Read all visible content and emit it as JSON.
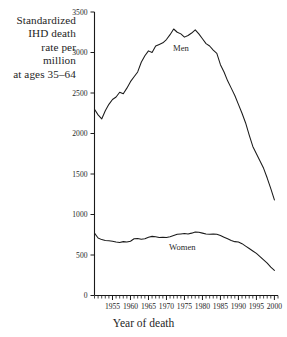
{
  "figure": {
    "y_axis_caption_lines": [
      "Standardized",
      "IHD death",
      "rate per",
      "million",
      "at ages 35–64"
    ],
    "x_axis_title": "Year of death",
    "series_labels": {
      "men": "Men",
      "women": "Women"
    },
    "line_color": "#1a1a1a",
    "axis_color": "#1a1a1a",
    "background": "#ffffff"
  },
  "chart_data": {
    "type": "line",
    "title": "",
    "xlabel": "Year of death",
    "ylabel": "Standardized IHD death rate per million at ages 35–64",
    "xlim": [
      1950,
      2001
    ],
    "ylim": [
      0,
      3500
    ],
    "yticks": [
      0,
      500,
      1000,
      1500,
      2000,
      2500,
      3000,
      3500
    ],
    "ytick_labels": [
      "0",
      "500",
      "1000",
      "1500",
      "2000",
      "2500",
      "3000",
      "3500"
    ],
    "xticks": [
      1955,
      1960,
      1965,
      1970,
      1975,
      1980,
      1985,
      1990,
      1995,
      2000
    ],
    "xtick_labels": [
      "1955",
      "1960",
      "1965",
      "1970",
      "1975",
      "1980",
      "1985",
      "1990",
      "1995",
      "2000"
    ],
    "xtick_minor_step": 1,
    "grid": false,
    "legend": "inline-annotation",
    "x": [
      1950,
      1951,
      1952,
      1953,
      1954,
      1955,
      1956,
      1957,
      1958,
      1959,
      1960,
      1961,
      1962,
      1963,
      1964,
      1965,
      1966,
      1967,
      1968,
      1969,
      1970,
      1971,
      1972,
      1973,
      1974,
      1975,
      1976,
      1977,
      1978,
      1979,
      1980,
      1981,
      1982,
      1983,
      1984,
      1985,
      1986,
      1987,
      1988,
      1989,
      1990,
      1991,
      1992,
      1993,
      1994,
      1995,
      1996,
      1997,
      1998,
      1999,
      2000
    ],
    "series": [
      {
        "name": "Men",
        "values": [
          2300,
          2230,
          2180,
          2280,
          2360,
          2420,
          2450,
          2510,
          2490,
          2560,
          2640,
          2700,
          2760,
          2880,
          2960,
          3020,
          3000,
          3080,
          3100,
          3120,
          3160,
          3220,
          3290,
          3250,
          3230,
          3190,
          3210,
          3240,
          3280,
          3230,
          3170,
          3110,
          3080,
          3030,
          2990,
          2850,
          2760,
          2650,
          2560,
          2470,
          2360,
          2250,
          2130,
          1980,
          1840,
          1750,
          1660,
          1570,
          1450,
          1320,
          1180
        ]
      },
      {
        "name": "Women",
        "values": [
          770,
          710,
          690,
          680,
          675,
          670,
          660,
          655,
          665,
          660,
          670,
          700,
          705,
          695,
          700,
          720,
          730,
          725,
          715,
          720,
          715,
          725,
          740,
          755,
          760,
          765,
          760,
          770,
          785,
          780,
          770,
          760,
          755,
          760,
          755,
          740,
          720,
          700,
          680,
          665,
          660,
          640,
          610,
          580,
          550,
          520,
          480,
          440,
          400,
          350,
          310
        ]
      }
    ]
  }
}
